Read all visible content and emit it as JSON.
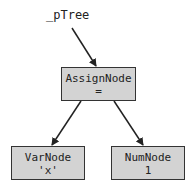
{
  "diagram": {
    "pointer_label": "_pTree",
    "nodes": [
      {
        "id": "assign",
        "title": "AssignNode",
        "value": "="
      },
      {
        "id": "var",
        "title": "VarNode",
        "value": "'x'"
      },
      {
        "id": "num",
        "title": "NumNode",
        "value": "1"
      }
    ],
    "edges": [
      {
        "from": "_pTree",
        "to": "assign"
      },
      {
        "from": "assign",
        "to": "var"
      },
      {
        "from": "assign",
        "to": "num"
      }
    ],
    "colors": {
      "node_fill": "#d3d3d3",
      "node_border": "#333333",
      "edge": "#222222"
    }
  }
}
